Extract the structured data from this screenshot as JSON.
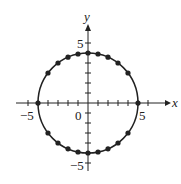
{
  "chart_data": {
    "type": "scatter",
    "title": "",
    "xlabel": "x",
    "ylabel": "y",
    "equation_implied": "x^2 + y^2 = 25",
    "xlim": [
      -6,
      6
    ],
    "ylim": [
      -6,
      6
    ],
    "grid": false,
    "tick_labels": {
      "x": [
        "-5",
        "5"
      ],
      "y": [
        "5",
        "-5"
      ],
      "origin": "0"
    },
    "circle": {
      "center": [
        0,
        0
      ],
      "radius": 5
    },
    "points": [
      [
        -5,
        0
      ],
      [
        -4,
        3
      ],
      [
        -3,
        4
      ],
      [
        -2,
        4.58
      ],
      [
        -1,
        4.9
      ],
      [
        0,
        5
      ],
      [
        1,
        4.9
      ],
      [
        2,
        4.58
      ],
      [
        3,
        4
      ],
      [
        4,
        3
      ],
      [
        5,
        0
      ],
      [
        -4,
        -3
      ],
      [
        -3,
        -4
      ],
      [
        -2,
        -4.58
      ],
      [
        -1,
        -4.9
      ],
      [
        0,
        -5
      ],
      [
        1,
        -4.9
      ],
      [
        2,
        -4.58
      ],
      [
        3,
        -4
      ],
      [
        4,
        -3
      ]
    ]
  },
  "labels": {
    "x": "x",
    "y": "y",
    "x_neg5": "−5",
    "x_pos5": "5",
    "y_pos5": "5",
    "y_neg5": "−5",
    "origin": "0"
  }
}
